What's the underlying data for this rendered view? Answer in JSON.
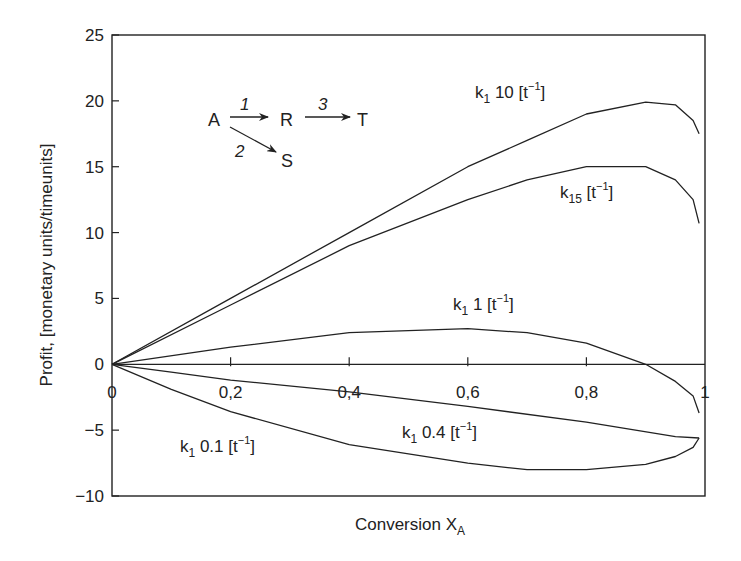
{
  "chart_data": {
    "type": "line",
    "title": "",
    "xlabel": "Conversion X",
    "xlabel_subscript": "A",
    "ylabel": "Profit, [monetary units/timeunits]",
    "xlim": [
      0,
      1
    ],
    "ylim": [
      -10,
      25
    ],
    "x_ticks": [
      0,
      0.2,
      0.4,
      0.6,
      0.8,
      1
    ],
    "x_tick_labels": [
      "0",
      "0,2",
      "0,4",
      "0,6",
      "0,8",
      "1"
    ],
    "y_ticks": [
      -10,
      -5,
      0,
      5,
      10,
      15,
      20,
      25
    ],
    "y_tick_labels": [
      "−10",
      "−5",
      "0",
      "5",
      "10",
      "15",
      "20",
      "25"
    ],
    "grid": false,
    "zero_line": true,
    "legend": "inline curve labels",
    "series": [
      {
        "name": "k1 10 [t^-1]",
        "label_main": "k",
        "label_sub": "1",
        "label_value": " 10 [t",
        "label_sup": "−1",
        "label_end": "]",
        "x": [
          0,
          0.2,
          0.4,
          0.6,
          0.7,
          0.8,
          0.9,
          0.95,
          0.98,
          0.99
        ],
        "y": [
          0,
          5.0,
          10.0,
          15.0,
          17.0,
          19.0,
          19.9,
          19.7,
          18.5,
          17.5
        ]
      },
      {
        "name": "k15 [t^-1]",
        "label_main": "k",
        "label_sub": "15",
        "label_value": " [t",
        "label_sup": "−1",
        "label_end": "]",
        "x": [
          0,
          0.2,
          0.4,
          0.6,
          0.7,
          0.8,
          0.9,
          0.95,
          0.98,
          0.99
        ],
        "y": [
          0,
          4.5,
          9.0,
          12.5,
          14.0,
          15.0,
          15.0,
          14.0,
          12.5,
          10.7
        ]
      },
      {
        "name": "k1 1 [t^-1]",
        "label_main": "k",
        "label_sub": "1",
        "label_value": " 1 [t",
        "label_sup": "−1",
        "label_end": "]",
        "x": [
          0,
          0.2,
          0.4,
          0.6,
          0.7,
          0.8,
          0.9,
          0.95,
          0.98,
          0.99
        ],
        "y": [
          0,
          1.3,
          2.4,
          2.7,
          2.4,
          1.6,
          0.0,
          -1.3,
          -2.4,
          -3.7
        ]
      },
      {
        "name": "k1 0.4 [t^-1]",
        "label_main": "k",
        "label_sub": "1",
        "label_value": " 0.4 [t",
        "label_sup": "−1",
        "label_end": "]",
        "x": [
          0,
          0.1,
          0.2,
          0.4,
          0.6,
          0.8,
          0.95,
          0.99
        ],
        "y": [
          0,
          -0.6,
          -1.2,
          -2.1,
          -3.2,
          -4.4,
          -5.5,
          -5.6
        ]
      },
      {
        "name": "k1 0.1 [t^-1]",
        "label_main": "k",
        "label_sub": "1",
        "label_value": " 0.1 [t",
        "label_sup": "−1",
        "label_end": "]",
        "x": [
          0,
          0.1,
          0.2,
          0.4,
          0.6,
          0.7,
          0.8,
          0.9,
          0.95,
          0.98,
          0.99
        ],
        "y": [
          0,
          -1.9,
          -3.6,
          -6.1,
          -7.5,
          -8.0,
          -8.0,
          -7.6,
          -7.0,
          -6.3,
          -5.6
        ]
      }
    ],
    "annotations": {
      "reaction_scheme": {
        "species": [
          "A",
          "R",
          "T",
          "S"
        ],
        "steps": [
          "1",
          "3",
          "2"
        ],
        "description": "A -1-> R -3-> T ; A -2-> S"
      }
    }
  },
  "ui": {
    "line_color": "#222222",
    "background": "#ffffff"
  }
}
